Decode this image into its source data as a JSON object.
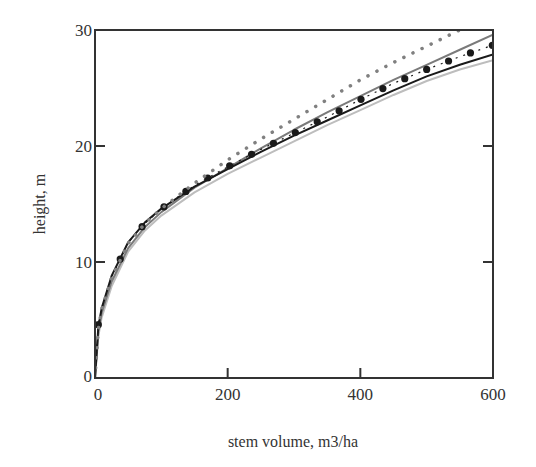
{
  "chart_data": {
    "type": "line",
    "title": "",
    "xlabel": "stem volume, m3/ha",
    "ylabel": "height, m",
    "xlim": [
      0,
      600
    ],
    "ylim": [
      0,
      30
    ],
    "x_ticks": [
      0,
      200,
      400,
      600
    ],
    "y_ticks": [
      0,
      10,
      20,
      30
    ],
    "grid": false,
    "legend": null,
    "x": [
      0,
      5,
      10,
      25,
      50,
      75,
      100,
      150,
      200,
      250,
      300,
      350,
      400,
      450,
      500,
      550,
      600
    ],
    "series": [
      {
        "name": "gray dotted",
        "style": "dotted",
        "color": "#808080",
        "values": [
          0,
          4.2,
          5.9,
          8.6,
          11.6,
          13.3,
          14.6,
          16.8,
          18.8,
          20.6,
          22.3,
          24.0,
          25.7,
          27.2,
          28.6,
          30.0,
          null
        ]
      },
      {
        "name": "black dots",
        "style": "markers",
        "color": "#1a1a1a",
        "values": [
          0,
          4.6,
          6.0,
          8.7,
          11.7,
          13.3,
          14.6,
          16.6,
          18.2,
          19.7,
          21.1,
          22.5,
          24.0,
          25.4,
          26.6,
          27.7,
          28.7
        ]
      },
      {
        "name": "black solid",
        "style": "solid",
        "color": "#1a1a1a",
        "values": [
          0,
          4.4,
          6.0,
          8.8,
          11.7,
          13.4,
          14.6,
          16.5,
          18.0,
          19.5,
          20.9,
          22.2,
          23.5,
          24.8,
          26.0,
          27.0,
          27.9
        ]
      },
      {
        "name": "gray solid",
        "style": "solid",
        "color": "#7a7a7a",
        "values": [
          0,
          4.0,
          5.6,
          8.3,
          11.2,
          13.0,
          14.3,
          16.4,
          18.1,
          19.8,
          21.4,
          22.9,
          24.3,
          25.7,
          27.0,
          28.3,
          29.6
        ]
      },
      {
        "name": "light gray solid",
        "style": "solid",
        "color": "#bdbdbd",
        "values": [
          0,
          3.6,
          5.2,
          7.9,
          10.9,
          12.7,
          14.0,
          16.0,
          17.6,
          19.0,
          20.4,
          21.8,
          23.1,
          24.4,
          25.6,
          26.6,
          27.4
        ]
      }
    ]
  },
  "axes": {
    "x_title": "stem volume, m3/ha",
    "y_title": "height, m",
    "x_tick_labels": [
      "0",
      "200",
      "400",
      "600"
    ],
    "y_tick_labels": [
      "0",
      "10",
      "20",
      "30"
    ]
  }
}
